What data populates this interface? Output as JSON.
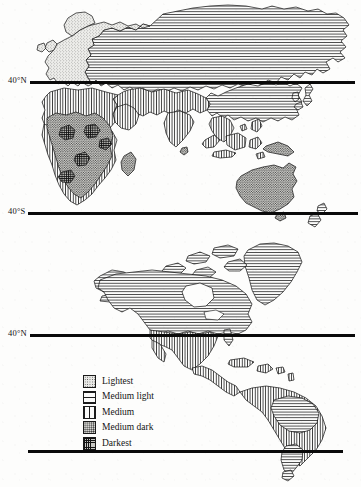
{
  "figure": {
    "background_color": "#fdfdfc",
    "ink_color": "#141414"
  },
  "latitude_lines": [
    {
      "id": "north-map-40n",
      "label": "40°N",
      "y": 81,
      "map": "eastern-hemisphere"
    },
    {
      "id": "north-map-40s",
      "label": "40°S",
      "y": 212,
      "map": "eastern-hemisphere"
    },
    {
      "id": "south-map-40n",
      "label": "40°N",
      "y": 334,
      "map": "americas"
    },
    {
      "id": "south-map-40s",
      "label": "",
      "y": 450,
      "map": "americas"
    }
  ],
  "legend": {
    "title": "",
    "items": [
      {
        "label": "Lightest",
        "pattern": "stipple-fine",
        "pattern_class": "pat-lightest",
        "swatch_color": "#e9e9e6"
      },
      {
        "label": "Medium light",
        "pattern": "horizontal-line",
        "pattern_class": "pat-medium-light",
        "swatch_color": "#fbfbfa"
      },
      {
        "label": "Medium",
        "pattern": "vertical-line",
        "pattern_class": "pat-medium",
        "swatch_color": "#fbfbfa"
      },
      {
        "label": "Medium dark",
        "pattern": "stipple-dense",
        "pattern_class": "pat-medium-dark",
        "swatch_color": "#d6d6d2"
      },
      {
        "label": "Darkest",
        "pattern": "cross-grid",
        "pattern_class": "pat-darkest",
        "swatch_color": "#c9c9c5"
      }
    ]
  },
  "maps": [
    {
      "id": "eastern-hemisphere",
      "name": "Eurasia, Africa, Australia",
      "regions": [
        {
          "name": "Europe",
          "shade": "Lightest"
        },
        {
          "name": "Northern Asia",
          "shade": "Medium light"
        },
        {
          "name": "Eastern Asia",
          "shade": "Medium light"
        },
        {
          "name": "North Africa",
          "shade": "Medium"
        },
        {
          "name": "Southwest Asia",
          "shade": "Medium"
        },
        {
          "name": "India",
          "shade": "Medium"
        },
        {
          "name": "Southeast Asia",
          "shade": "Medium"
        },
        {
          "name": "Sub-Saharan Africa",
          "shade": "Medium dark"
        },
        {
          "name": "Central Africa",
          "shade": "Darkest"
        },
        {
          "name": "Australia",
          "shade": "Medium dark"
        },
        {
          "name": "New Guinea",
          "shade": "Medium dark"
        },
        {
          "name": "Madagascar",
          "shade": "Medium dark"
        },
        {
          "name": "New Zealand",
          "shade": "Medium light"
        }
      ]
    },
    {
      "id": "americas",
      "name": "North and South America",
      "regions": [
        {
          "name": "Canada",
          "shade": "Medium light"
        },
        {
          "name": "Greenland",
          "shade": "Medium light"
        },
        {
          "name": "United States",
          "shade": "Medium light"
        },
        {
          "name": "Mexico",
          "shade": "Medium"
        },
        {
          "name": "Central America",
          "shade": "Medium"
        },
        {
          "name": "Caribbean",
          "shade": "Medium"
        },
        {
          "name": "Northern South America",
          "shade": "Medium"
        },
        {
          "name": "Amazon Basin",
          "shade": "Medium light"
        },
        {
          "name": "Southern South America",
          "shade": "Medium"
        }
      ]
    }
  ],
  "caption_remnant": ""
}
